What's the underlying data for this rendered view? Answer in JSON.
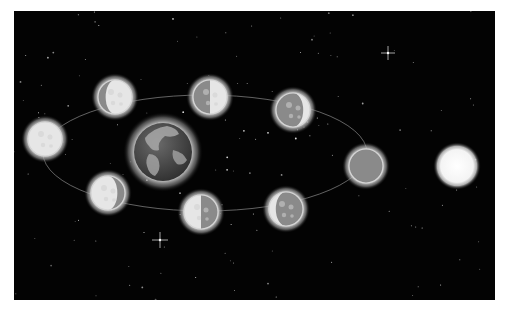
{
  "scene": {
    "title": "Phases of the Moon orbiting Earth with the Sun",
    "background_color": "#030303",
    "palette": {
      "moon_light": "#e6e6e6",
      "moon_dark": "#8a8a8a",
      "moon_glow": "#bdbdbd",
      "earth_ocean": "#4a4a4a",
      "earth_land": "#a8a8a8",
      "sun": "#ffffff",
      "orbit": "#9a9a9a"
    },
    "earth": {
      "label": "Earth",
      "cx": 163,
      "cy": 152,
      "r": 34
    },
    "sun": {
      "label": "Sun",
      "cx": 457,
      "cy": 166,
      "r": 19
    },
    "moons": [
      {
        "phase": "full-moon",
        "label": "Full Moon",
        "cx": 45,
        "cy": 139,
        "r": 21,
        "lit": "full"
      },
      {
        "phase": "waning-gibbous",
        "label": "Waning Gibbous",
        "cx": 115,
        "cy": 97,
        "r": 21,
        "lit": "gibbous-right"
      },
      {
        "phase": "last-quarter",
        "label": "Last Quarter",
        "cx": 210,
        "cy": 97,
        "r": 21,
        "lit": "half-right"
      },
      {
        "phase": "waning-crescent",
        "label": "Waning Crescent",
        "cx": 293,
        "cy": 110,
        "r": 21,
        "lit": "crescent-right"
      },
      {
        "phase": "new-moon",
        "label": "New Moon",
        "cx": 366,
        "cy": 166,
        "r": 21,
        "lit": "none"
      },
      {
        "phase": "waxing-crescent",
        "label": "Waxing Crescent",
        "cx": 286,
        "cy": 209,
        "r": 21,
        "lit": "crescent-left"
      },
      {
        "phase": "first-quarter",
        "label": "First Quarter",
        "cx": 201,
        "cy": 212,
        "r": 21,
        "lit": "half-left"
      },
      {
        "phase": "waxing-gibbous",
        "label": "Waxing Gibbous",
        "cx": 108,
        "cy": 193,
        "r": 21,
        "lit": "gibbous-left"
      }
    ],
    "sparkles": [
      {
        "cx": 388,
        "cy": 53,
        "size": 7
      },
      {
        "cx": 160,
        "cy": 240,
        "size": 8
      }
    ]
  }
}
